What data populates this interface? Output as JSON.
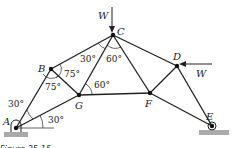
{
  "diagram": {
    "type": "truss",
    "nodes": {
      "A": {
        "label": "A",
        "x": 16,
        "y": 128
      },
      "B": {
        "label": "B",
        "x": 51,
        "y": 69
      },
      "C": {
        "label": "C",
        "x": 113,
        "y": 35
      },
      "D": {
        "label": "D",
        "x": 177,
        "y": 66
      },
      "E": {
        "label": "E",
        "x": 212,
        "y": 126
      },
      "F": {
        "label": "F",
        "x": 150,
        "y": 93
      },
      "G": {
        "label": "G",
        "x": 79,
        "y": 95
      }
    },
    "members": [
      "AB",
      "AG",
      "BC",
      "BG",
      "GC",
      "GF",
      "CF",
      "CD",
      "DF",
      "DE",
      "FE"
    ],
    "loads": [
      {
        "node": "C",
        "label": "W",
        "direction": "down"
      },
      {
        "node": "D",
        "label": "W",
        "direction": "left"
      }
    ],
    "angles": {
      "a_upper": "30°",
      "a_lower": "30°",
      "b_upper": "75°",
      "b_lower": "75°",
      "c_left": "30°",
      "c_right": "60°",
      "g": "60°"
    },
    "supports": {
      "A": "pin",
      "E": "roller"
    },
    "caption": "Figure 25-15"
  }
}
